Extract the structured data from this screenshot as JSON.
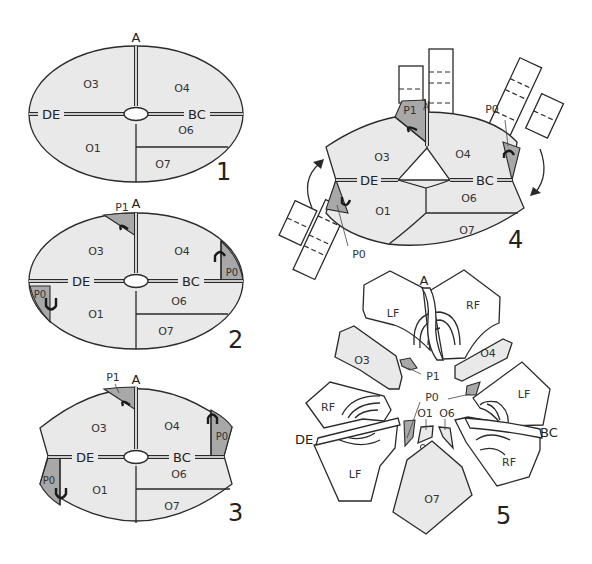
{
  "figure": {
    "panels": [
      {
        "number": "1",
        "labels": {
          "top": "A",
          "left": "DE",
          "right": "BC"
        },
        "regions": [
          "O3",
          "O4",
          "O1",
          "O6",
          "O7"
        ]
      },
      {
        "number": "2",
        "labels": {
          "top": "A",
          "left": "DE",
          "right": "BC"
        },
        "regions": [
          "O3",
          "O4",
          "O1",
          "O6",
          "O7"
        ],
        "markers": [
          "P1",
          "P0",
          "P0"
        ]
      },
      {
        "number": "3",
        "labels": {
          "top": "A",
          "left": "DE",
          "right": "BC"
        },
        "regions": [
          "O3",
          "O4",
          "O1",
          "O6",
          "O7"
        ],
        "markers": [
          "P1",
          "P0",
          "P0"
        ]
      },
      {
        "number": "4",
        "labels": {
          "top": "A",
          "left": "DE",
          "right": "BC"
        },
        "regions": [
          "O3",
          "O4",
          "O1",
          "O6",
          "O7"
        ],
        "markers": [
          "P1",
          "P0",
          "P0"
        ]
      },
      {
        "number": "5",
        "labels": {
          "top": "A",
          "left": "DE",
          "right": "BC"
        },
        "regions": [
          "O3",
          "O4",
          "O1",
          "O6",
          "O7"
        ],
        "markers": [
          "P1",
          "P0"
        ],
        "flaps": [
          "LF",
          "RF",
          "LF",
          "RF",
          "RF",
          "LF"
        ]
      }
    ]
  }
}
